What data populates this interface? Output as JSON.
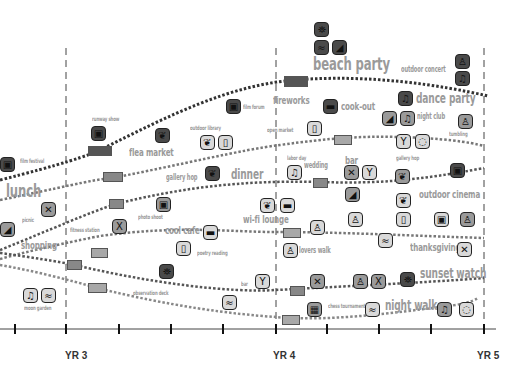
{
  "axis": {
    "year_labels": [
      {
        "label": "YR 3",
        "x": 66
      },
      {
        "label": "YR 4",
        "x": 276
      },
      {
        "label": "YR 5",
        "x": 484
      }
    ],
    "tick_x": [
      15,
      66,
      119,
      171,
      223,
      276,
      327,
      379,
      431,
      484
    ]
  },
  "activities": {
    "beach_party": "beach party",
    "outdoor_concert": "outdoor concert",
    "fireworks": "fireworks",
    "cook_out": "cook-out",
    "dance_party": "dance party",
    "film_forum": "film forum",
    "runway_show": "runway show",
    "outdoor_library": "outdoor library",
    "open_market": "open market",
    "night_club": "night club",
    "flea_market": "flea market",
    "tumbling": "tumbling",
    "film_festival": "film festival",
    "labor_day": "labor day",
    "wedding": "wedding",
    "bar_top": "bar",
    "gallery_hop_right": "gallery hop",
    "lunch": "lunch",
    "gallery_hop_left": "gallery hop",
    "dinner": "dinner",
    "outdoor_cinema": "outdoor cinema",
    "picnic": "picnic",
    "photo_shoot": "photo shoot",
    "wi_fi_lounge": "wi-fi lounge",
    "fitness_station": "fitness station",
    "cool_cafe": "cool cafe",
    "shopping": "shopping",
    "poetry_reading": "poetry reading",
    "lovers_walk": "lovers walk",
    "thanksgiving": "thanksgiving",
    "bar_bottom": "bar",
    "sunset_watch": "sunset watch",
    "observation_deck": "observation deck",
    "moon_garden": "moon garden",
    "chess_tournament": "chess tournament",
    "night_walk": "night walk"
  },
  "icons": {
    "binoculars": "⛯",
    "camera": "▣",
    "fork_knife": "✕",
    "cocktail": "Y",
    "bulb": "◌",
    "book": "▯",
    "heel": "◢",
    "walker": "♙",
    "swimmer": "≈",
    "fitness": "X",
    "chess": "▦",
    "cup": "▬",
    "dancers": "♫",
    "tree": "❦"
  },
  "colors": {
    "line": "#444444",
    "line_light": "#8a8a8a",
    "dashed": "#555555",
    "label": "#9a9a9a"
  }
}
